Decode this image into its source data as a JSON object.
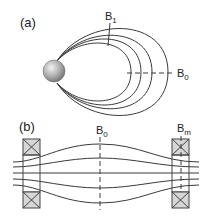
{
  "panel_a": {
    "label": "(a)",
    "field_line_label": "B",
    "field_line_sub": "1",
    "center_label": "B",
    "center_sub": "0"
  },
  "panel_b": {
    "label": "(b)",
    "center_label": "B",
    "center_sub": "0",
    "mirror_label": "B",
    "mirror_sub": "m"
  },
  "colors": {
    "line": "#3a3a3a",
    "coil_fill": "#d0d0d0",
    "sphere_light": "#e8e8e8",
    "sphere_dark": "#7a7a7a"
  }
}
